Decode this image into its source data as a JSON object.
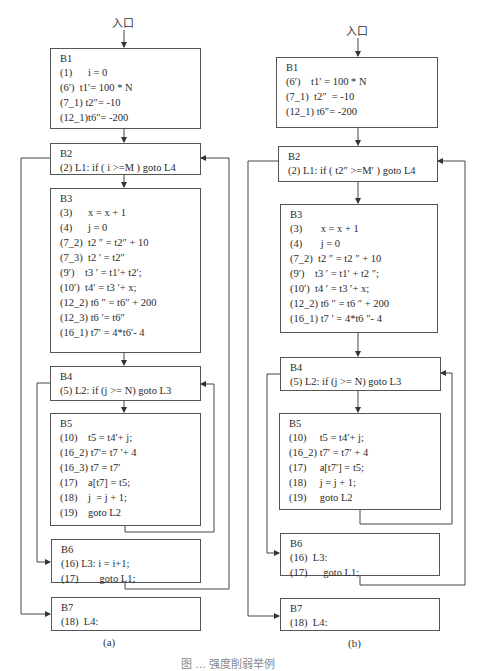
{
  "entry_label": "入口",
  "figure_title": "图 ... 强度削弱举例",
  "diagram_a": {
    "caption": "(a)",
    "blocks": {
      "B1": {
        "name": "B1",
        "lines": [
          {
            "num": "(1)",
            "code": "      i = 0"
          },
          {
            "num": "(6′)",
            "code": "  t1′= 100 * N"
          },
          {
            "num": "(7_1)",
            "code": " t2″= -10"
          },
          {
            "num": "(12_1)",
            "code": "t6″= -200"
          }
        ]
      },
      "B2": {
        "name": "B2",
        "lines": [
          {
            "num": "(2)",
            "code": " L1: if ( i >=M ) goto L4"
          }
        ]
      },
      "B3": {
        "name": "B3",
        "lines": [
          {
            "num": "(3)",
            "code": "      x = x + 1"
          },
          {
            "num": "(4)",
            "code": "      j = 0"
          },
          {
            "num": "(7_2)",
            "code": "  t2 ″ = t2″ + 10"
          },
          {
            "num": "(7_3)",
            "code": "  t2 ′ = t2″"
          },
          {
            "num": "(9′)",
            "code": "    t3 ′ = t1′+ t2′;"
          },
          {
            "num": "(10′)",
            "code": "  t4′ = t3 ′+ x;"
          },
          {
            "num": "(12_2)",
            "code": " t6 ″ = t6″ + 200"
          },
          {
            "num": "(12_3)",
            "code": " t6 ′= t6″"
          },
          {
            "num": "(16_1)",
            "code": " t7′ = 4*t6′- 4"
          }
        ]
      },
      "B4": {
        "name": "B4",
        "lines": [
          {
            "num": "(5)",
            "code": " L2: if (j >= N) goto L3"
          }
        ]
      },
      "B5": {
        "name": "B5",
        "lines": [
          {
            "num": "(10)",
            "code": "    t5 = t4′+ j;"
          },
          {
            "num": "(16_2)",
            "code": " t7′= t7 ′+ 4"
          },
          {
            "num": "(16_3)",
            "code": " t7 = t7′"
          },
          {
            "num": "(17)",
            "code": "    a[t7] = t5;"
          },
          {
            "num": "(18)",
            "code": "    j  = j + 1;"
          },
          {
            "num": "(19)",
            "code": "    goto L2"
          }
        ]
      },
      "B6": {
        "name": "B6",
        "lines": [
          {
            "num": "(16)",
            "code": " L3: i = i+1;"
          },
          {
            "num": "(17)",
            "code": "        goto L1;"
          }
        ]
      },
      "B7": {
        "name": "B7",
        "lines": [
          {
            "num": "(18)",
            "code": "  L4:"
          }
        ]
      }
    }
  },
  "diagram_b": {
    "caption": "(b)",
    "blocks": {
      "B1": {
        "name": "B1",
        "lines": [
          {
            "num": "(6′)",
            "code": "    t1′ = 100 * N"
          },
          {
            "num": "(7_1)",
            "code": "  t2″  = -10"
          },
          {
            "num": "(12_1)",
            "code": " t6″= -200"
          }
        ]
      },
      "B2": {
        "name": "B2",
        "lines": [
          {
            "num": "(2)",
            "code": " L1: if ( t2″ >=M′ ) goto L4"
          }
        ]
      },
      "B3": {
        "name": "B3",
        "lines": [
          {
            "num": "(3)",
            "code": "       x = x + 1"
          },
          {
            "num": "(4)",
            "code": "       j = 0"
          },
          {
            "num": "(7_2)",
            "code": "  t2 ″ = t2 ″ + 10"
          },
          {
            "num": "(9′)",
            "code": "    t3 ′ = t1′ + t2 ″;"
          },
          {
            "num": "(10′)",
            "code": "  t4 ′ = t3 ′+ x;"
          },
          {
            "num": "(12_2)",
            "code": " t6 ″ = t6 ″ + 200"
          },
          {
            "num": "(16_1)",
            "code": " t7 ′ = 4*t6 ″- 4"
          }
        ]
      },
      "B4": {
        "name": "B4",
        "lines": [
          {
            "num": "(5)",
            "code": " L2: if (j >= N) goto L3"
          }
        ]
      },
      "B5": {
        "name": "B5",
        "lines": [
          {
            "num": "(10)",
            "code": "     t5 = t4′+ j;"
          },
          {
            "num": "(16_2)",
            "code": " t7′ = t7′ + 4"
          },
          {
            "num": "(17)",
            "code": "     a[t7′] = t5;"
          },
          {
            "num": "(18)",
            "code": "     j = j + 1;"
          },
          {
            "num": "(19)",
            "code": "     goto L2"
          }
        ]
      },
      "B6": {
        "name": "B6",
        "lines": [
          {
            "num": "(16)",
            "code": "  L3:"
          },
          {
            "num": "(17)",
            "code": "      goto L1;"
          }
        ]
      },
      "B7": {
        "name": "B7",
        "lines": [
          {
            "num": "(18)",
            "code": "  L4:"
          }
        ]
      }
    }
  }
}
